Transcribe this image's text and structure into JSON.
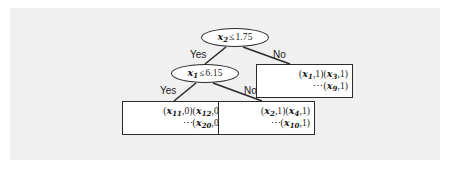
{
  "figure": {
    "type": "decision-tree",
    "panel_color": "#f0f0f0",
    "background_color": "#ffffff",
    "line_color": "#2b2b2b"
  },
  "tree": {
    "root": {
      "id": "root-node",
      "shape": "ellipse",
      "variable": "x",
      "subscript": "2",
      "operator": "≤",
      "threshold": "1.75",
      "text": "x2 ≤ 1.75"
    },
    "split": {
      "id": "split-node",
      "shape": "ellipse",
      "variable": "x",
      "subscript": "1",
      "operator": "≤",
      "threshold": "6.15",
      "text": "x1 ≤ 6.15"
    },
    "edges": [
      {
        "id": "root-yes",
        "label": "Yes",
        "from": "root-node",
        "to": "split-node"
      },
      {
        "id": "root-no",
        "label": "No",
        "from": "root-node",
        "to": "leaf-right"
      },
      {
        "id": "split-yes",
        "label": "Yes",
        "from": "split-node",
        "to": "leaf-left"
      },
      {
        "id": "split-no",
        "label": "No",
        "from": "split-node",
        "to": "leaf-mid"
      }
    ],
    "leaves": [
      {
        "id": "leaf-right",
        "shape": "rectangle",
        "class_label": "1",
        "line1": [
          {
            "variable": "x",
            "subscript": "1",
            "label": "1"
          },
          {
            "variable": "x",
            "subscript": "3",
            "label": "1"
          }
        ],
        "line2": [
          {
            "ellipsis": "⋯"
          },
          {
            "variable": "x",
            "subscript": "9",
            "label": "1"
          }
        ]
      },
      {
        "id": "leaf-left",
        "shape": "rectangle",
        "class_label": "0",
        "line1": [
          {
            "variable": "x",
            "subscript": "11",
            "label": "0"
          },
          {
            "variable": "x",
            "subscript": "12",
            "label": "0"
          }
        ],
        "line2": [
          {
            "ellipsis": "⋯"
          },
          {
            "variable": "x",
            "subscript": "20",
            "label": "0"
          }
        ]
      },
      {
        "id": "leaf-mid",
        "shape": "rectangle",
        "class_label": "1",
        "line1": [
          {
            "variable": "x",
            "subscript": "2",
            "label": "1"
          },
          {
            "variable": "x",
            "subscript": "4",
            "label": "1"
          }
        ],
        "line2": [
          {
            "ellipsis": "⋯"
          },
          {
            "variable": "x",
            "subscript": "10",
            "label": "1"
          }
        ]
      }
    ]
  }
}
